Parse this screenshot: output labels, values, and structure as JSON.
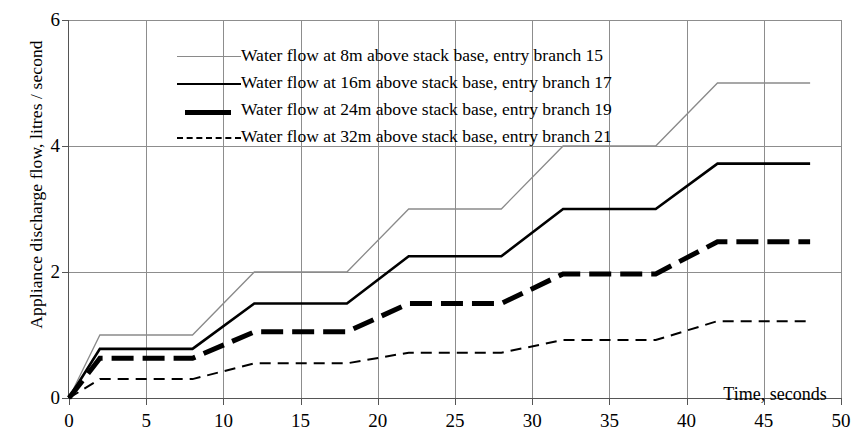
{
  "chart_data": {
    "type": "line",
    "title": "",
    "xlabel": "Time, seconds",
    "ylabel": "Appliance discharge flow, litres / second",
    "xlim": [
      0,
      50
    ],
    "ylim": [
      0,
      6
    ],
    "xticks": [
      0,
      5,
      10,
      15,
      20,
      25,
      30,
      35,
      40,
      45,
      50
    ],
    "yticks": [
      0,
      2,
      4,
      6
    ],
    "grid": true,
    "legend_position": "top-left-inside",
    "series": [
      {
        "name": "Water flow at 8m above stack base, entry branch 15",
        "key": "branch15",
        "style": "thin-solid-gray",
        "color": "#8a8a8a",
        "width": 1.3,
        "dash": "none",
        "x": [
          0,
          2,
          8,
          12,
          18,
          22,
          28,
          32,
          38,
          42,
          48
        ],
        "y": [
          0,
          1.0,
          1.0,
          2.0,
          2.0,
          3.0,
          3.0,
          4.0,
          4.0,
          5.0,
          5.0
        ]
      },
      {
        "name": "Water flow at 16m  above stack base, entry branch 17",
        "key": "branch17",
        "style": "medium-solid-black",
        "color": "#000000",
        "width": 2.6,
        "dash": "none",
        "x": [
          0,
          2,
          8,
          12,
          18,
          22,
          28,
          32,
          38,
          42,
          48
        ],
        "y": [
          0,
          0.78,
          0.78,
          1.5,
          1.5,
          2.25,
          2.25,
          3.0,
          3.0,
          3.72,
          3.72
        ]
      },
      {
        "name": "Water flow at 24m above stack base, entry branch 19",
        "key": "branch19",
        "style": "thick-dashed-black",
        "color": "#000000",
        "width": 5.0,
        "dash": "22 9",
        "x": [
          0,
          2,
          8,
          12,
          18,
          22,
          28,
          32,
          38,
          42,
          48
        ],
        "y": [
          0,
          0.63,
          0.63,
          1.05,
          1.05,
          1.5,
          1.5,
          1.97,
          1.97,
          2.48,
          2.48
        ]
      },
      {
        "name": "Water flow at 32m above stack base, entry branch 21",
        "key": "branch21",
        "style": "thin-dashed-black",
        "color": "#000000",
        "width": 2.0,
        "dash": "11 7",
        "x": [
          0,
          2,
          8,
          12,
          18,
          22,
          28,
          32,
          38,
          42,
          48
        ],
        "y": [
          0,
          0.3,
          0.3,
          0.55,
          0.55,
          0.72,
          0.72,
          0.92,
          0.92,
          1.22,
          1.22
        ]
      }
    ]
  },
  "axis": {
    "y_title": "Appliance discharge flow, litres / second",
    "x_title": "Time, seconds",
    "ytick_labels": [
      "0",
      "2",
      "4",
      "6"
    ],
    "xtick_labels": [
      "0",
      "5",
      "10",
      "15",
      "20",
      "25",
      "30",
      "35",
      "40",
      "45",
      "50"
    ]
  },
  "legend": {
    "items": [
      {
        "label": "Water flow at 8m above stack base, entry branch 15"
      },
      {
        "label": "Water flow at 16m  above stack base, entry branch 17"
      },
      {
        "label": "Water flow at 24m above stack base, entry branch 19"
      },
      {
        "label": "Water flow at 32m above stack base, entry branch 21"
      }
    ]
  }
}
